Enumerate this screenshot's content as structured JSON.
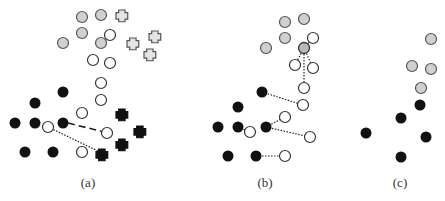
{
  "figure": {
    "colors": {
      "gray_fill": "#d0d0d0",
      "stroke": "#555555",
      "black": "#111111",
      "white": "#ffffff"
    },
    "panels": [
      {
        "label": "(a)",
        "label_x": 68,
        "gray_circles": [
          [
            82,
            17
          ],
          [
            101,
            15
          ],
          [
            82,
            33
          ],
          [
            63,
            43
          ],
          [
            101,
            43
          ]
        ],
        "white_circles": [
          [
            110,
            35
          ],
          [
            93,
            60
          ],
          [
            110,
            63
          ],
          [
            101,
            83
          ],
          [
            101,
            100
          ],
          [
            82,
            113
          ],
          [
            48,
            127
          ],
          [
            107,
            133
          ],
          [
            82,
            152
          ]
        ],
        "black_dots": [
          [
            63,
            92
          ],
          [
            35,
            103
          ],
          [
            15,
            123
          ],
          [
            35,
            123
          ],
          [
            63,
            123
          ],
          [
            25,
            152
          ],
          [
            53,
            152
          ]
        ],
        "outline_plus": [
          [
            122,
            16
          ],
          [
            133,
            44
          ],
          [
            155,
            37
          ],
          [
            150,
            55
          ]
        ],
        "black_plus": [
          [
            122,
            115
          ],
          [
            140,
            132
          ],
          [
            122,
            145
          ],
          [
            102,
            155
          ]
        ],
        "dashed_lines": [
          [
            [
              68,
              123
            ],
            [
              104,
              132
            ]
          ]
        ],
        "dotted_lines": [
          [
            [
              48,
              127
            ],
            [
              100,
              152
            ]
          ]
        ]
      },
      {
        "label": "(b)",
        "label_x": 245,
        "gray_circles": [
          [
            285,
            22
          ],
          [
            304,
            19
          ],
          [
            285,
            38
          ],
          [
            266,
            48
          ]
        ],
        "hub_circle": [
          304,
          48
        ],
        "white_circles": [
          [
            313,
            38
          ],
          [
            295,
            65
          ],
          [
            313,
            68
          ],
          [
            304,
            88
          ],
          [
            303,
            105
          ],
          [
            285,
            117
          ],
          [
            250,
            132
          ],
          [
            310,
            137
          ],
          [
            285,
            156
          ]
        ],
        "black_dots": [
          [
            262,
            92
          ],
          [
            238,
            107
          ],
          [
            218,
            127
          ],
          [
            238,
            127
          ],
          [
            266,
            127
          ],
          [
            228,
            156
          ],
          [
            256,
            156
          ]
        ],
        "dotted_lines": [
          [
            [
              304,
              48
            ],
            [
              313,
              38
            ]
          ],
          [
            [
              304,
              48
            ],
            [
              295,
              65
            ]
          ],
          [
            [
              304,
              48
            ],
            [
              313,
              68
            ]
          ],
          [
            [
              304,
              48
            ],
            [
              304,
              88
            ]
          ],
          [
            [
              262,
              92
            ],
            [
              303,
              105
            ]
          ],
          [
            [
              266,
              127
            ],
            [
              285,
              117
            ]
          ],
          [
            [
              266,
              127
            ],
            [
              310,
              137
            ]
          ],
          [
            [
              238,
              127
            ],
            [
              250,
              132
            ]
          ],
          [
            [
              256,
              156
            ],
            [
              285,
              156
            ]
          ]
        ]
      },
      {
        "label": "(c)",
        "label_x": 380,
        "gray_circles": [
          [
            431,
            39
          ],
          [
            412,
            66
          ],
          [
            431,
            69
          ],
          [
            421,
            88
          ]
        ],
        "black_dots": [
          [
            420,
            105
          ],
          [
            401,
            118
          ],
          [
            366,
            133
          ],
          [
            426,
            137
          ],
          [
            401,
            157
          ]
        ]
      }
    ]
  }
}
